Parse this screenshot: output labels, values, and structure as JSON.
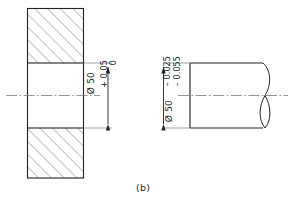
{
  "figure": {
    "caption": "(b)",
    "type": "engineering-drawing",
    "background": "#ffffff",
    "line_color": "#222222",
    "hatch_color": "#6b6b6b",
    "centerline_color": "#7a7a7a"
  },
  "hole_view": {
    "name": "hole-section-view",
    "description": "sectioned plate with bore",
    "dimension": {
      "symbol": "Ø",
      "nominal": "Ø 50",
      "upper_tolerance": "+ 0.05",
      "lower_tolerance": "0",
      "full_text": "Ø 50 +0.05 / 0"
    }
  },
  "shaft_view": {
    "name": "shaft-view",
    "description": "cylindrical shaft with break line",
    "dimension": {
      "symbol": "Ø",
      "nominal": "Ø 50",
      "upper_tolerance": "– 0.025",
      "lower_tolerance": "– 0.055",
      "full_text": "Ø 50 –0.025 / –0.055"
    }
  }
}
